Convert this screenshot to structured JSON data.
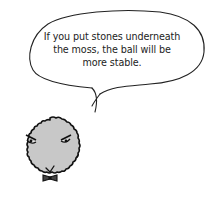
{
  "illustration": {
    "speech_bubble": {
      "lines": [
        "If you put stones underneath",
        "the moss, the ball will be",
        "more stable."
      ]
    },
    "character": {
      "name": "moss-ball",
      "fill_color": "#c8c8c8",
      "outline_color": "#111111",
      "expression": "angry eyes, small v-mouth, bow tie"
    }
  }
}
